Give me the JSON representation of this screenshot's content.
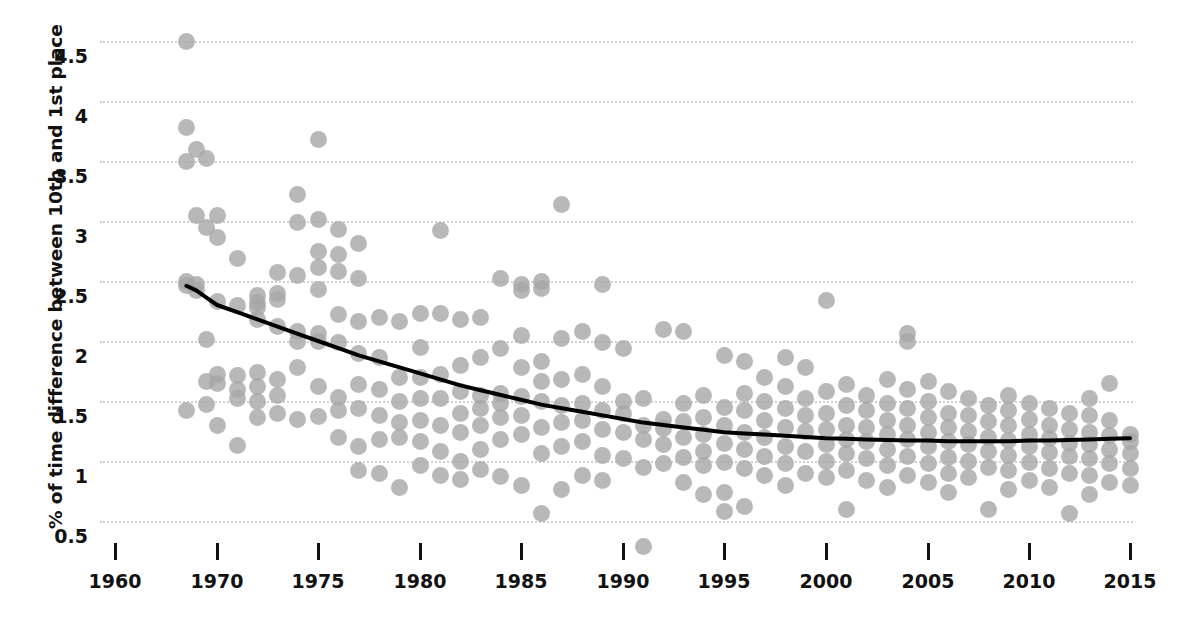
{
  "chart_data": {
    "type": "scatter",
    "title": "",
    "xlabel": "",
    "ylabel": "% of time difference between 10th and 1st place",
    "grid": true,
    "legend": null,
    "xlim": [
      1960,
      2015
    ],
    "ylim": [
      0.25,
      4.7
    ],
    "xticks": [
      1960,
      1970,
      1975,
      1980,
      1985,
      1990,
      1995,
      2000,
      2005,
      2010,
      2015
    ],
    "xtick_labels": [
      "1960",
      "1970",
      "1975",
      "1980",
      "1985",
      "1990",
      "1995",
      "2000",
      "2005",
      "2010",
      "2015"
    ],
    "xtick_px": [
      115,
      217,
      318,
      420,
      521,
      623,
      724,
      826,
      928,
      1029,
      1130
    ],
    "yticks": [
      0.5,
      1,
      1.5,
      2,
      2.5,
      3,
      3.5,
      4,
      4.5
    ],
    "ytick_labels": [
      "0.5",
      "1",
      "1.5",
      "2",
      "2.5",
      "3",
      "3.5",
      "4",
      "4.5"
    ],
    "marker_color": "#a6a6a6",
    "marker_opacity": 0.8,
    "marker_size_px": 17,
    "trend_color": "#000000",
    "trend_width_px": 4,
    "grid_color": "#cfcfcf",
    "axis_text_color": "#111111",
    "background": "#ffffff",
    "trend_line": {
      "label": "fitted decay trend",
      "x": [
        1967,
        1968,
        1969,
        1970,
        1971,
        1972,
        1973,
        1974,
        1975,
        1976,
        1977,
        1978,
        1979,
        1980,
        1981,
        1982,
        1983,
        1984,
        1985,
        1986,
        1987,
        1988,
        1989,
        1990,
        1991,
        1992,
        1993,
        1994,
        1995,
        1996,
        1997,
        1998,
        1999,
        2000,
        2001,
        2002,
        2003,
        2004,
        2005,
        2006,
        2007,
        2008,
        2009,
        2010,
        2011,
        2012,
        2013,
        2014,
        2015
      ],
      "y": [
        2.46,
        2.42,
        2.36,
        2.3,
        2.24,
        2.18,
        2.12,
        2.06,
        2.0,
        1.94,
        1.88,
        1.83,
        1.78,
        1.73,
        1.68,
        1.63,
        1.59,
        1.55,
        1.51,
        1.47,
        1.44,
        1.41,
        1.38,
        1.35,
        1.32,
        1.3,
        1.28,
        1.26,
        1.24,
        1.23,
        1.22,
        1.21,
        1.2,
        1.19,
        1.185,
        1.18,
        1.175,
        1.17,
        1.17,
        1.165,
        1.165,
        1.165,
        1.165,
        1.17,
        1.17,
        1.175,
        1.18,
        1.185,
        1.19
      ]
    },
    "points": [
      [
        1967,
        4.5
      ],
      [
        1967,
        3.78
      ],
      [
        1967,
        3.5
      ],
      [
        1967,
        2.5
      ],
      [
        1967,
        2.46
      ],
      [
        1967,
        1.42
      ],
      [
        1968,
        3.6
      ],
      [
        1968,
        3.05
      ],
      [
        1968,
        2.47
      ],
      [
        1968,
        2.42
      ],
      [
        1969,
        3.52
      ],
      [
        1969,
        2.95
      ],
      [
        1969,
        2.01
      ],
      [
        1969,
        1.66
      ],
      [
        1969,
        1.47
      ],
      [
        1970,
        3.05
      ],
      [
        1970,
        2.86
      ],
      [
        1970,
        2.33
      ],
      [
        1970,
        1.72
      ],
      [
        1970,
        1.65
      ],
      [
        1970,
        1.3
      ],
      [
        1971,
        2.69
      ],
      [
        1971,
        2.3
      ],
      [
        1971,
        1.71
      ],
      [
        1971,
        1.6
      ],
      [
        1971,
        1.52
      ],
      [
        1971,
        1.13
      ],
      [
        1972,
        2.38
      ],
      [
        1972,
        2.32
      ],
      [
        1972,
        2.28
      ],
      [
        1972,
        2.18
      ],
      [
        1972,
        1.74
      ],
      [
        1972,
        1.62
      ],
      [
        1972,
        1.5
      ],
      [
        1972,
        1.36
      ],
      [
        1973,
        2.57
      ],
      [
        1973,
        2.4
      ],
      [
        1973,
        2.35
      ],
      [
        1973,
        2.12
      ],
      [
        1973,
        1.68
      ],
      [
        1973,
        1.55
      ],
      [
        1973,
        1.4
      ],
      [
        1974,
        3.22
      ],
      [
        1974,
        2.99
      ],
      [
        1974,
        2.55
      ],
      [
        1974,
        2.08
      ],
      [
        1974,
        2.0
      ],
      [
        1974,
        1.78
      ],
      [
        1974,
        1.35
      ],
      [
        1975,
        3.68
      ],
      [
        1975,
        3.01
      ],
      [
        1975,
        2.75
      ],
      [
        1975,
        2.61
      ],
      [
        1975,
        2.43
      ],
      [
        1975,
        2.06
      ],
      [
        1975,
        2.0
      ],
      [
        1975,
        1.62
      ],
      [
        1975,
        1.37
      ],
      [
        1976,
        2.93
      ],
      [
        1976,
        2.72
      ],
      [
        1976,
        2.58
      ],
      [
        1976,
        2.22
      ],
      [
        1976,
        1.99
      ],
      [
        1976,
        1.53
      ],
      [
        1976,
        1.42
      ],
      [
        1976,
        1.2
      ],
      [
        1977,
        2.81
      ],
      [
        1977,
        2.52
      ],
      [
        1977,
        2.16
      ],
      [
        1977,
        1.9
      ],
      [
        1977,
        1.64
      ],
      [
        1977,
        1.44
      ],
      [
        1977,
        1.12
      ],
      [
        1977,
        0.92
      ],
      [
        1978,
        2.2
      ],
      [
        1978,
        1.86
      ],
      [
        1978,
        1.6
      ],
      [
        1978,
        1.38
      ],
      [
        1978,
        1.18
      ],
      [
        1978,
        0.9
      ],
      [
        1979,
        2.16
      ],
      [
        1979,
        1.7
      ],
      [
        1979,
        1.5
      ],
      [
        1979,
        1.32
      ],
      [
        1979,
        1.2
      ],
      [
        1979,
        0.78
      ],
      [
        1980,
        2.23
      ],
      [
        1980,
        1.95
      ],
      [
        1980,
        1.7
      ],
      [
        1980,
        1.52
      ],
      [
        1980,
        1.34
      ],
      [
        1980,
        1.16
      ],
      [
        1980,
        0.96
      ],
      [
        1981,
        2.92
      ],
      [
        1981,
        2.23
      ],
      [
        1981,
        1.72
      ],
      [
        1981,
        1.52
      ],
      [
        1981,
        1.3
      ],
      [
        1981,
        1.08
      ],
      [
        1981,
        0.88
      ],
      [
        1982,
        2.18
      ],
      [
        1982,
        1.8
      ],
      [
        1982,
        1.58
      ],
      [
        1982,
        1.4
      ],
      [
        1982,
        1.24
      ],
      [
        1982,
        1.0
      ],
      [
        1982,
        0.85
      ],
      [
        1983,
        2.2
      ],
      [
        1983,
        1.86
      ],
      [
        1983,
        1.55
      ],
      [
        1983,
        1.44
      ],
      [
        1983,
        1.3
      ],
      [
        1983,
        1.1
      ],
      [
        1983,
        0.93
      ],
      [
        1984,
        2.52
      ],
      [
        1984,
        1.94
      ],
      [
        1984,
        1.56
      ],
      [
        1984,
        1.48
      ],
      [
        1984,
        1.36
      ],
      [
        1984,
        1.18
      ],
      [
        1984,
        0.87
      ],
      [
        1985,
        2.47
      ],
      [
        1985,
        2.42
      ],
      [
        1985,
        2.05
      ],
      [
        1985,
        1.78
      ],
      [
        1985,
        1.54
      ],
      [
        1985,
        1.38
      ],
      [
        1985,
        1.22
      ],
      [
        1985,
        0.8
      ],
      [
        1986,
        2.5
      ],
      [
        1986,
        2.44
      ],
      [
        1986,
        1.83
      ],
      [
        1986,
        1.66
      ],
      [
        1986,
        1.5
      ],
      [
        1986,
        1.28
      ],
      [
        1986,
        1.06
      ],
      [
        1986,
        0.56
      ],
      [
        1987,
        3.14
      ],
      [
        1987,
        2.02
      ],
      [
        1987,
        1.68
      ],
      [
        1987,
        1.46
      ],
      [
        1987,
        1.32
      ],
      [
        1987,
        1.12
      ],
      [
        1987,
        0.76
      ],
      [
        1988,
        2.08
      ],
      [
        1988,
        1.72
      ],
      [
        1988,
        1.48
      ],
      [
        1988,
        1.34
      ],
      [
        1988,
        1.16
      ],
      [
        1988,
        0.88
      ],
      [
        1989,
        2.47
      ],
      [
        1989,
        1.99
      ],
      [
        1989,
        1.62
      ],
      [
        1989,
        1.42
      ],
      [
        1989,
        1.26
      ],
      [
        1989,
        1.05
      ],
      [
        1989,
        0.84
      ],
      [
        1990,
        1.94
      ],
      [
        1990,
        1.5
      ],
      [
        1990,
        1.4
      ],
      [
        1990,
        1.24
      ],
      [
        1990,
        1.02
      ],
      [
        1991,
        1.52
      ],
      [
        1991,
        1.3
      ],
      [
        1991,
        1.18
      ],
      [
        1991,
        0.95
      ],
      [
        1991,
        0.29
      ],
      [
        1992,
        2.1
      ],
      [
        1992,
        1.35
      ],
      [
        1992,
        1.27
      ],
      [
        1992,
        1.14
      ],
      [
        1992,
        0.98
      ],
      [
        1993,
        2.08
      ],
      [
        1993,
        1.48
      ],
      [
        1993,
        1.33
      ],
      [
        1993,
        1.2
      ],
      [
        1993,
        1.03
      ],
      [
        1993,
        0.82
      ],
      [
        1994,
        1.55
      ],
      [
        1994,
        1.36
      ],
      [
        1994,
        1.22
      ],
      [
        1994,
        1.08
      ],
      [
        1994,
        0.96
      ],
      [
        1994,
        0.72
      ],
      [
        1995,
        1.88
      ],
      [
        1995,
        1.45
      ],
      [
        1995,
        1.3
      ],
      [
        1995,
        1.15
      ],
      [
        1995,
        0.99
      ],
      [
        1995,
        0.74
      ],
      [
        1995,
        0.58
      ],
      [
        1996,
        1.83
      ],
      [
        1996,
        1.56
      ],
      [
        1996,
        1.42
      ],
      [
        1996,
        1.24
      ],
      [
        1996,
        1.1
      ],
      [
        1996,
        0.94
      ],
      [
        1996,
        0.62
      ],
      [
        1997,
        1.7
      ],
      [
        1997,
        1.5
      ],
      [
        1997,
        1.34
      ],
      [
        1997,
        1.2
      ],
      [
        1997,
        1.04
      ],
      [
        1997,
        0.88
      ],
      [
        1998,
        1.86
      ],
      [
        1998,
        1.62
      ],
      [
        1998,
        1.44
      ],
      [
        1998,
        1.28
      ],
      [
        1998,
        1.12
      ],
      [
        1998,
        0.98
      ],
      [
        1998,
        0.8
      ],
      [
        1999,
        1.78
      ],
      [
        1999,
        1.52
      ],
      [
        1999,
        1.38
      ],
      [
        1999,
        1.25
      ],
      [
        1999,
        1.08
      ],
      [
        1999,
        0.9
      ],
      [
        2000,
        2.34
      ],
      [
        2000,
        1.58
      ],
      [
        2000,
        1.4
      ],
      [
        2000,
        1.26
      ],
      [
        2000,
        1.14
      ],
      [
        2000,
        1.0
      ],
      [
        2000,
        0.86
      ],
      [
        2001,
        1.64
      ],
      [
        2001,
        1.46
      ],
      [
        2001,
        1.3
      ],
      [
        2001,
        1.18
      ],
      [
        2001,
        1.06
      ],
      [
        2001,
        0.92
      ],
      [
        2001,
        0.6
      ],
      [
        2002,
        1.55
      ],
      [
        2002,
        1.42
      ],
      [
        2002,
        1.28
      ],
      [
        2002,
        1.16
      ],
      [
        2002,
        1.02
      ],
      [
        2002,
        0.84
      ],
      [
        2003,
        1.68
      ],
      [
        2003,
        1.48
      ],
      [
        2003,
        1.34
      ],
      [
        2003,
        1.22
      ],
      [
        2003,
        1.1
      ],
      [
        2003,
        0.96
      ],
      [
        2003,
        0.78
      ],
      [
        2004,
        2.06
      ],
      [
        2004,
        2.0
      ],
      [
        2004,
        1.6
      ],
      [
        2004,
        1.44
      ],
      [
        2004,
        1.3
      ],
      [
        2004,
        1.18
      ],
      [
        2004,
        1.04
      ],
      [
        2004,
        0.88
      ],
      [
        2005,
        1.66
      ],
      [
        2005,
        1.5
      ],
      [
        2005,
        1.36
      ],
      [
        2005,
        1.24
      ],
      [
        2005,
        1.12
      ],
      [
        2005,
        0.98
      ],
      [
        2005,
        0.82
      ],
      [
        2006,
        1.58
      ],
      [
        2006,
        1.4
      ],
      [
        2006,
        1.28
      ],
      [
        2006,
        1.16
      ],
      [
        2006,
        1.03
      ],
      [
        2006,
        0.9
      ],
      [
        2006,
        0.74
      ],
      [
        2007,
        1.52
      ],
      [
        2007,
        1.38
      ],
      [
        2007,
        1.25
      ],
      [
        2007,
        1.14
      ],
      [
        2007,
        1.0
      ],
      [
        2007,
        0.86
      ],
      [
        2008,
        1.46
      ],
      [
        2008,
        1.33
      ],
      [
        2008,
        1.2
      ],
      [
        2008,
        1.08
      ],
      [
        2008,
        0.95
      ],
      [
        2008,
        0.6
      ],
      [
        2009,
        1.55
      ],
      [
        2009,
        1.42
      ],
      [
        2009,
        1.3
      ],
      [
        2009,
        1.17
      ],
      [
        2009,
        1.05
      ],
      [
        2009,
        0.92
      ],
      [
        2009,
        0.76
      ],
      [
        2010,
        1.48
      ],
      [
        2010,
        1.35
      ],
      [
        2010,
        1.22
      ],
      [
        2010,
        1.12
      ],
      [
        2010,
        0.99
      ],
      [
        2010,
        0.84
      ],
      [
        2011,
        1.44
      ],
      [
        2011,
        1.3
      ],
      [
        2011,
        1.19
      ],
      [
        2011,
        1.07
      ],
      [
        2011,
        0.94
      ],
      [
        2011,
        0.78
      ],
      [
        2012,
        1.4
      ],
      [
        2012,
        1.26
      ],
      [
        2012,
        1.15
      ],
      [
        2012,
        1.04
      ],
      [
        2012,
        0.9
      ],
      [
        2012,
        0.56
      ],
      [
        2013,
        1.52
      ],
      [
        2013,
        1.38
      ],
      [
        2013,
        1.24
      ],
      [
        2013,
        1.14
      ],
      [
        2013,
        1.02
      ],
      [
        2013,
        0.88
      ],
      [
        2013,
        0.72
      ],
      [
        2014,
        1.65
      ],
      [
        2014,
        1.34
      ],
      [
        2014,
        1.21
      ],
      [
        2014,
        1.1
      ],
      [
        2014,
        0.98
      ],
      [
        2014,
        0.82
      ],
      [
        2015,
        1.22
      ],
      [
        2015,
        1.16
      ],
      [
        2015,
        1.06
      ],
      [
        2015,
        0.94
      ],
      [
        2015,
        0.8
      ]
    ]
  }
}
